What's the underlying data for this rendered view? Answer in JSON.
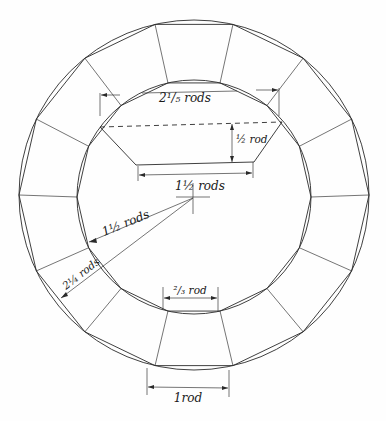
{
  "diagram": {
    "segment_count": 14,
    "labels": {
      "top_width": "2¹/₅ rods",
      "trap_height": "½ rod",
      "trap_bottom": "1½ rods",
      "inner_radius": "1½ rods",
      "outer_radius": "2¼ rods",
      "inner_segment": "²/₃ rod",
      "outer_segment": "1rod"
    },
    "colors": {
      "ink": "#2a2a2a",
      "paper": "#fefefe"
    }
  }
}
